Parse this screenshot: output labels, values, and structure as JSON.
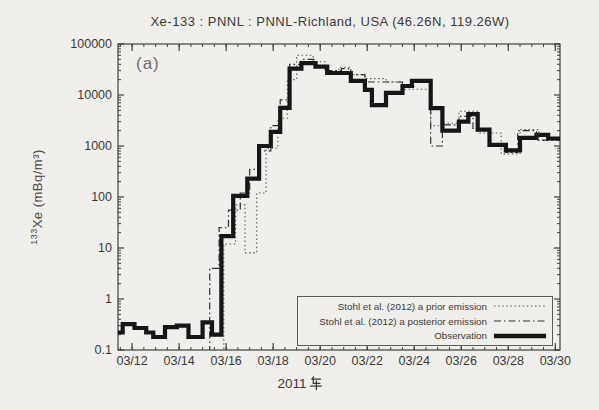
{
  "chart": {
    "title": "Xe-133 :  PNNL :  PNNL-Richland, USA  (46.26N, 119.26W)",
    "panel_label": "(a)",
    "ylabel_isotope_sup": "133",
    "ylabel_text": "Xe (mBq/m³)",
    "xlabel": "2011年",
    "xlabel_number": "2011",
    "colors": {
      "paper": "#f1efeb",
      "ink": "#3c3c3c",
      "axis": "#3f3f3f"
    }
  },
  "chart_data": {
    "type": "line",
    "subtype": "step-log",
    "title": "Xe-133 :  PNNL :  PNNL-Richland, USA  (46.26N, 119.26W)",
    "xlabel": "2011年",
    "ylabel": "133Xe (mBq/m3)",
    "grid": false,
    "legend_position": "inside lower right",
    "scale": {
      "x_range_march_days": [
        11.4,
        30.2
      ],
      "y_log_range": [
        0.1,
        100000
      ]
    },
    "x_ticks": [
      {
        "day": 12,
        "label": "03/12"
      },
      {
        "day": 14,
        "label": "03/14"
      },
      {
        "day": 16,
        "label": "03/16"
      },
      {
        "day": 18,
        "label": "03/18"
      },
      {
        "day": 20,
        "label": "03/20"
      },
      {
        "day": 22,
        "label": "03/22"
      },
      {
        "day": 24,
        "label": "03/24"
      },
      {
        "day": 26,
        "label": "03/26"
      },
      {
        "day": 28,
        "label": "03/28"
      },
      {
        "day": 30,
        "label": "03/30"
      }
    ],
    "x_minor_tick_step_days": 0.5,
    "y_ticks": [
      {
        "value": 100000,
        "label": "100000"
      },
      {
        "value": 10000,
        "label": "10000"
      },
      {
        "value": 1000,
        "label": "1000"
      },
      {
        "value": 100,
        "label": "100"
      },
      {
        "value": 10,
        "label": "10"
      },
      {
        "value": 1,
        "label": "1"
      },
      {
        "value": 0.1,
        "label": "0.1"
      }
    ],
    "legend": [
      {
        "label": "Stohl et al. (2012)  a prior emission",
        "style": "dotted"
      },
      {
        "label": "Stohl et al. (2012)  a posterior emission",
        "style": "dashdot"
      },
      {
        "label": "Observation",
        "style": "solid-thick"
      }
    ],
    "series": [
      {
        "name": "Stohl et al. (2012) a prior emission",
        "style": "dotted",
        "rises_from_baseline": true,
        "end_day": 30.2,
        "points": [
          [
            15.9,
            12
          ],
          [
            16.4,
            70
          ],
          [
            16.8,
            8
          ],
          [
            17.3,
            120
          ],
          [
            17.7,
            900
          ],
          [
            18.2,
            3500
          ],
          [
            18.6,
            20000
          ],
          [
            19.0,
            60000
          ],
          [
            19.7,
            45000
          ],
          [
            20.2,
            30000
          ],
          [
            20.8,
            35000
          ],
          [
            21.3,
            25000
          ],
          [
            21.9,
            21000
          ],
          [
            22.8,
            18000
          ],
          [
            23.5,
            13000
          ],
          [
            24.7,
            2500
          ],
          [
            25.2,
            2800
          ],
          [
            25.9,
            4800
          ],
          [
            26.7,
            1800
          ],
          [
            27.7,
            700
          ],
          [
            28.5,
            2100
          ],
          [
            29.3,
            1300
          ]
        ]
      },
      {
        "name": "Stohl et al. (2012) a posterior emission",
        "style": "dashdot",
        "rises_from_baseline": true,
        "end_day": 30.2,
        "points": [
          [
            15.3,
            4
          ],
          [
            15.7,
            25
          ],
          [
            16.1,
            55
          ],
          [
            16.6,
            120
          ],
          [
            17.0,
            350
          ],
          [
            17.4,
            800
          ],
          [
            17.9,
            2500
          ],
          [
            18.3,
            8000
          ],
          [
            18.7,
            40000
          ],
          [
            19.2,
            50000
          ],
          [
            19.8,
            35000
          ],
          [
            20.3,
            30000
          ],
          [
            20.9,
            33000
          ],
          [
            21.3,
            25000
          ],
          [
            21.9,
            18000
          ],
          [
            23.5,
            15000
          ],
          [
            24.0,
            20000
          ],
          [
            24.7,
            1000
          ],
          [
            25.2,
            2600
          ],
          [
            25.9,
            3800
          ],
          [
            26.5,
            2200
          ],
          [
            27.2,
            1100
          ],
          [
            27.9,
            750
          ],
          [
            28.4,
            2000
          ],
          [
            29.2,
            1300
          ]
        ]
      },
      {
        "name": "Observation",
        "style": "solid-thick",
        "rises_from_baseline": false,
        "end_day": 30.2,
        "points": [
          [
            11.4,
            0.22
          ],
          [
            11.6,
            0.32
          ],
          [
            12.1,
            0.27
          ],
          [
            12.6,
            0.22
          ],
          [
            12.9,
            0.18
          ],
          [
            13.4,
            0.28
          ],
          [
            13.9,
            0.3
          ],
          [
            14.4,
            0.18
          ],
          [
            15.0,
            0.35
          ],
          [
            15.4,
            0.2
          ],
          [
            15.8,
            17
          ],
          [
            16.3,
            105
          ],
          [
            16.9,
            230
          ],
          [
            17.4,
            1000
          ],
          [
            17.9,
            1900
          ],
          [
            18.3,
            5600
          ],
          [
            18.7,
            33000
          ],
          [
            19.2,
            42000
          ],
          [
            19.8,
            36000
          ],
          [
            20.3,
            27000
          ],
          [
            21.3,
            19000
          ],
          [
            21.9,
            12600
          ],
          [
            22.2,
            6300
          ],
          [
            22.8,
            11000
          ],
          [
            23.5,
            15000
          ],
          [
            23.9,
            19000
          ],
          [
            24.7,
            5500
          ],
          [
            25.2,
            2000
          ],
          [
            25.9,
            3000
          ],
          [
            26.3,
            4200
          ],
          [
            26.7,
            2100
          ],
          [
            27.2,
            1050
          ],
          [
            27.9,
            820
          ],
          [
            28.5,
            1450
          ],
          [
            29.2,
            1650
          ],
          [
            29.7,
            1400
          ]
        ]
      }
    ]
  }
}
